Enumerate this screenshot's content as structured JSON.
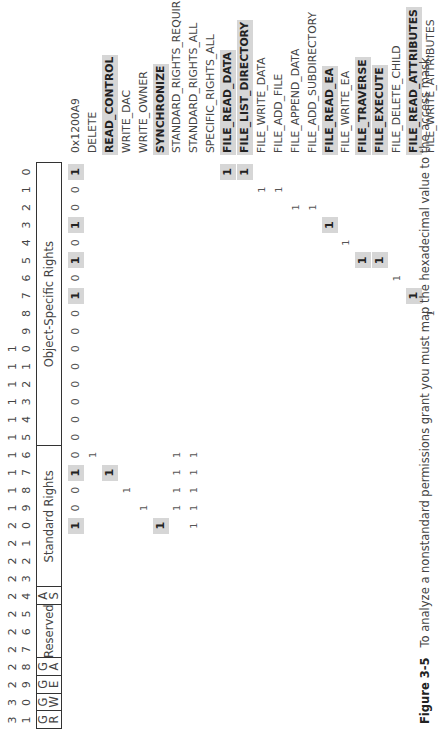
{
  "figure": {
    "number": "Figure 3-5",
    "caption": "To analyze a nonstandard permissions grant you must map the hexadecimal value to the access mask."
  },
  "bit_header": {
    "tens": [
      "3",
      "3",
      "2",
      "2",
      "2",
      "2",
      "2",
      "2",
      "2",
      "2",
      "2",
      "2",
      "1",
      "1",
      "1",
      "1",
      "1",
      "1",
      "1",
      "1",
      "1",
      "1",
      "",
      "",
      "",
      "",
      "",
      "",
      "",
      "",
      "",
      ""
    ],
    "units": [
      "1",
      "0",
      "9",
      "8",
      "7",
      "6",
      "5",
      "4",
      "3",
      "2",
      "1",
      "0",
      "9",
      "8",
      "7",
      "6",
      "5",
      "4",
      "3",
      "2",
      "1",
      "0",
      "9",
      "8",
      "7",
      "6",
      "5",
      "4",
      "3",
      "2",
      "1",
      "0"
    ]
  },
  "fields": [
    {
      "label": "G\nR",
      "from_bit": 31,
      "to_bit": 31
    },
    {
      "label": "G\nW",
      "from_bit": 30,
      "to_bit": 30
    },
    {
      "label": "G\nE",
      "from_bit": 29,
      "to_bit": 29
    },
    {
      "label": "G\nA",
      "from_bit": 28,
      "to_bit": 28
    },
    {
      "label": "Reserved",
      "from_bit": 27,
      "to_bit": 25
    },
    {
      "label": "A\nS",
      "from_bit": 24,
      "to_bit": 24
    },
    {
      "label": "Standard Rights",
      "from_bit": 23,
      "to_bit": 16
    },
    {
      "label": "Object-Specific Rights",
      "from_bit": 15,
      "to_bit": 0
    }
  ],
  "rows": [
    {
      "label": "0x1200A9",
      "bold": false,
      "bits": {
        "20": "1",
        "19": "0",
        "18": "0",
        "17": "1",
        "16": "0",
        "15": "0",
        "14": "0",
        "13": "0",
        "12": "0",
        "11": "0",
        "10": "0",
        "9": "0",
        "8": "0",
        "7": "1",
        "6": "0",
        "5": "1",
        "4": "0",
        "3": "1",
        "2": "0",
        "1": "0",
        "0": "1"
      },
      "highlight_bits": [
        20,
        17,
        7,
        5,
        3,
        0
      ]
    },
    {
      "label": "DELETE",
      "bold": false,
      "bits": {
        "16": "1"
      },
      "highlight_bits": []
    },
    {
      "label": "READ_CONTROL",
      "bold": true,
      "bits": {
        "17": "1"
      },
      "highlight_bits": [
        17
      ]
    },
    {
      "label": "WRITE_DAC",
      "bold": false,
      "bits": {
        "18": "1"
      },
      "highlight_bits": []
    },
    {
      "label": "WRITE_OWNER",
      "bold": false,
      "bits": {
        "19": "1"
      },
      "highlight_bits": []
    },
    {
      "label": "SYNCHRONIZE",
      "bold": true,
      "bits": {
        "20": "1"
      },
      "highlight_bits": [
        20
      ]
    },
    {
      "label": "STANDARD_RIGHTS_REQUIRED",
      "bold": false,
      "bits": {
        "19": "1",
        "18": "1",
        "17": "1",
        "16": "1"
      },
      "highlight_bits": []
    },
    {
      "label": "STANDARD_RIGHTS_ALL",
      "bold": false,
      "bits": {
        "20": "1",
        "19": "1",
        "18": "1",
        "17": "1",
        "16": "1"
      },
      "highlight_bits": []
    },
    {
      "label": "SPECIFIC_RIGHTS_ALL",
      "bold": false,
      "bits": {},
      "highlight_bits": []
    },
    {
      "label": "FILE_READ_DATA",
      "bold": true,
      "bits": {
        "0": "1"
      },
      "highlight_bits": [
        0
      ]
    },
    {
      "label": "FILE_LIST_DIRECTORY",
      "bold": true,
      "bits": {
        "0": "1"
      },
      "highlight_bits": [
        0
      ]
    },
    {
      "label": "FILE_WRITE_DATA",
      "bold": false,
      "bits": {
        "1": "1"
      },
      "highlight_bits": []
    },
    {
      "label": "FILE_ADD_FILE",
      "bold": false,
      "bits": {
        "1": "1"
      },
      "highlight_bits": []
    },
    {
      "label": "FILE_APPEND_DATA",
      "bold": false,
      "bits": {
        "2": "1"
      },
      "highlight_bits": []
    },
    {
      "label": "FILE_ADD_SUBDIRECTORY",
      "bold": false,
      "bits": {
        "2": "1"
      },
      "highlight_bits": []
    },
    {
      "label": "FILE_READ_EA",
      "bold": true,
      "bits": {
        "3": "1"
      },
      "highlight_bits": [
        3
      ]
    },
    {
      "label": "FILE_WRITE_EA",
      "bold": false,
      "bits": {
        "4": "1"
      },
      "highlight_bits": []
    },
    {
      "label": "FILE_TRAVERSE",
      "bold": true,
      "bits": {
        "5": "1"
      },
      "highlight_bits": [
        5
      ]
    },
    {
      "label": "FILE_EXECUTE",
      "bold": true,
      "bits": {
        "5": "1"
      },
      "highlight_bits": [
        5
      ]
    },
    {
      "label": "FILE_DELETE_CHILD",
      "bold": false,
      "bits": {
        "6": "1"
      },
      "highlight_bits": []
    },
    {
      "label": "FILE_READ_ATTRIBUTES",
      "bold": true,
      "bits": {
        "7": "1"
      },
      "highlight_bits": [
        7
      ]
    },
    {
      "label": "FILE_WRITE_ATTRIBUTES",
      "bold": false,
      "bits": {
        "8": "1"
      },
      "highlight_bits": []
    }
  ],
  "colors": {
    "highlight": "#d6d6d6",
    "border": "#333333",
    "text": "#444444"
  }
}
